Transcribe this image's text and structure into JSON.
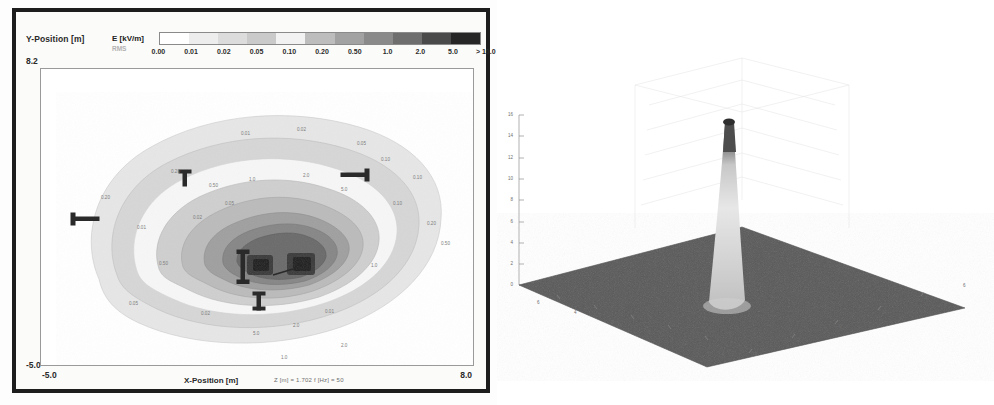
{
  "contour_panel": {
    "y_axis_title": "Y-Position [m]",
    "y_axis_max": "8.2",
    "y_axis_min": "-5.0",
    "x_axis_title": "X-Position [m]",
    "x_axis_min": "-5.0",
    "x_axis_max": "8.0",
    "scan_params": "Z [m] = 1.702    f [Hz] = 50",
    "colorbar": {
      "title": "E [kV/m]",
      "subtitle": "RMS",
      "tick_labels": [
        "0.00",
        "0.01",
        "0.02",
        "0.05",
        "0.10",
        "0.20",
        "0.50",
        "1.0",
        "2.0",
        "5.0",
        "> 10.0"
      ],
      "band_colors": [
        "#ffffff",
        "#ededed",
        "#dcdcdc",
        "#cacaca",
        "#f2f2f2",
        "#bdbdbd",
        "#a2a2a2",
        "#8a8a8a",
        "#6e6e6e",
        "#4a4a4a",
        "#262626"
      ]
    },
    "inline_contour_labels": [
      "0.01",
      "0.02",
      "0.05",
      "0.10",
      "0.20",
      "0.50",
      "1.0",
      "2.0",
      "5.0"
    ]
  },
  "surface_panel": {
    "title": "80 kV / 178 kV",
    "z_axis_label": "E [kV/m]",
    "x_axis_label": "x[m]",
    "y_axis_label": "y[m]",
    "z_ticks": [
      "0",
      "2",
      "4",
      "6",
      "8",
      "10",
      "12",
      "14",
      "16"
    ],
    "x_ticks": [
      "6",
      "4",
      "2",
      "0",
      "-2",
      "-4"
    ],
    "y_ticks": [
      "-4",
      "-2",
      "0",
      "2",
      "4",
      "6"
    ]
  },
  "chart_data": [
    {
      "type": "heatmap",
      "title": "E-field contour map",
      "xlabel": "X-Position [m]",
      "ylabel": "Y-Position [m]",
      "xlim": [
        -5.0,
        8.0
      ],
      "ylim": [
        -5.0,
        8.2
      ],
      "grid": false,
      "legend_position": "top",
      "colorbar_label": "E [kV/m] RMS",
      "levels": [
        0.0,
        0.01,
        0.02,
        0.05,
        0.1,
        0.2,
        0.5,
        1.0,
        2.0,
        5.0,
        10.0
      ],
      "level_labels": [
        "0.00",
        "0.01",
        "0.02",
        "0.05",
        "0.10",
        "0.20",
        "0.50",
        "1.0",
        "2.0",
        "5.0",
        "> 10.0"
      ],
      "annotations": [
        "Z [m] = 1.702",
        "f [Hz] = 50"
      ],
      "peak_value": 10.0,
      "peak_location": [
        1.2,
        0.4
      ]
    },
    {
      "type": "area",
      "title": "80 kV / 178 kV",
      "xlabel": "x[m]",
      "ylabel": "y[m]",
      "zlabel": "E [kV/m]",
      "xlim": [
        -4,
        6
      ],
      "ylim": [
        -4,
        6
      ],
      "zlim": [
        0,
        16
      ],
      "grid": true,
      "legend_position": "none",
      "z_ticks": [
        0,
        2,
        4,
        6,
        8,
        10,
        12,
        14,
        16
      ],
      "x_ticks": [
        6,
        4,
        2,
        0,
        -2,
        -4
      ],
      "y_ticks": [
        -4,
        -2,
        0,
        2,
        4,
        6
      ],
      "peak_value": 15.0,
      "peak_location": [
        0.5,
        0.5
      ],
      "baseline_value": 0.2
    }
  ]
}
